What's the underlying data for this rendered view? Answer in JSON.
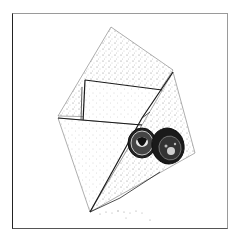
{
  "image": {
    "description": "Stippled black-and-white illustration of an open envelope with a letter inside and two coins resting on the front",
    "subjects": [
      "envelope",
      "letter",
      "coin",
      "coin"
    ],
    "colors": {
      "background": "#ffffff",
      "ink": "#1a1a1a",
      "stipple": "#8a8a8a",
      "frame": "#9a9a9a"
    }
  }
}
